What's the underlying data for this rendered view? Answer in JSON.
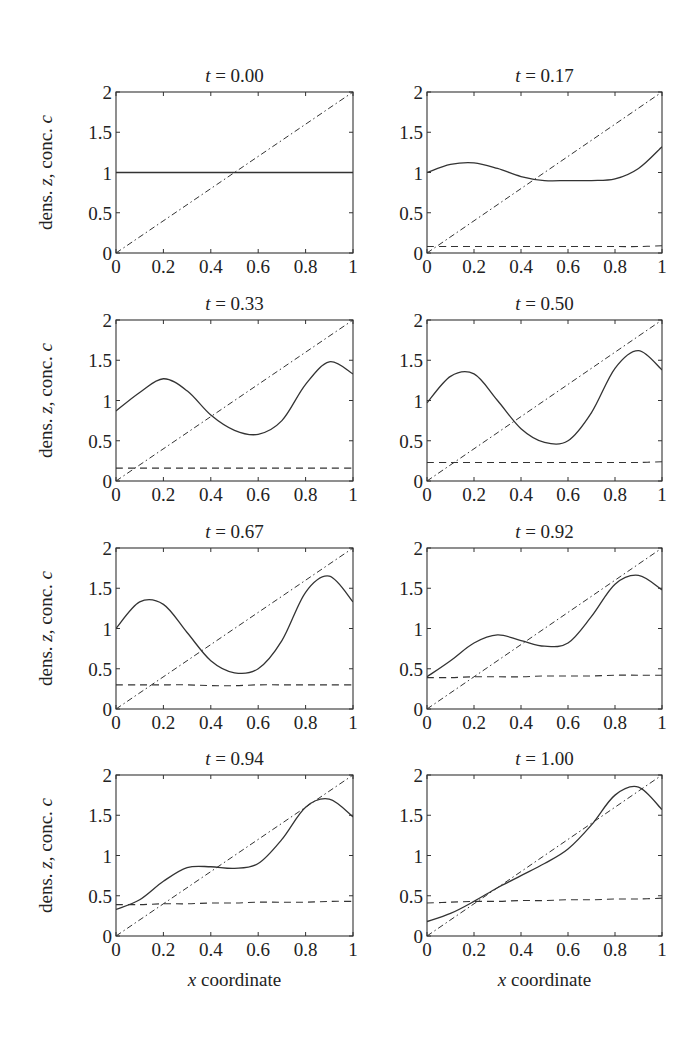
{
  "figure": {
    "ylabel": "dens. z, conc. c",
    "xlabel": "x coordinate"
  },
  "chart_data": [
    {
      "type": "line",
      "title": "t = 0.00",
      "xlabel": "",
      "ylabel": "dens. z, conc. c",
      "xlim": [
        0,
        1
      ],
      "ylim": [
        0,
        2
      ],
      "xticks": [
        "0",
        "0.2",
        "0.4",
        "0.6",
        "0.8",
        "1"
      ],
      "yticks": [
        "0",
        "0.5",
        "1",
        "1.5",
        "2"
      ],
      "grid": false,
      "x": [
        0,
        0.1,
        0.2,
        0.3,
        0.4,
        0.5,
        0.6,
        0.7,
        0.8,
        0.9,
        1.0
      ],
      "series": [
        {
          "name": "density z (solid)",
          "style": "solid",
          "values": [
            1,
            1,
            1,
            1,
            1,
            1,
            1,
            1,
            1,
            1,
            1
          ]
        },
        {
          "name": "dash-dot reference",
          "style": "dashdot",
          "values": [
            0,
            0.2,
            0.4,
            0.6,
            0.8,
            1.0,
            1.2,
            1.4,
            1.6,
            1.8,
            2.0
          ]
        }
      ]
    },
    {
      "type": "line",
      "title": "t = 0.17",
      "xlabel": "",
      "ylabel": "",
      "xlim": [
        0,
        1
      ],
      "ylim": [
        0,
        2
      ],
      "xticks": [
        "0",
        "0.2",
        "0.4",
        "0.6",
        "0.8",
        "1"
      ],
      "yticks": [
        "0",
        "0.5",
        "1",
        "1.5",
        "2"
      ],
      "grid": false,
      "x": [
        0,
        0.1,
        0.2,
        0.3,
        0.4,
        0.5,
        0.6,
        0.7,
        0.8,
        0.9,
        1.0
      ],
      "series": [
        {
          "name": "density z (solid)",
          "style": "solid",
          "values": [
            1.0,
            1.1,
            1.12,
            1.05,
            0.95,
            0.9,
            0.9,
            0.9,
            0.92,
            1.05,
            1.32
          ]
        },
        {
          "name": "concentration c (dashed)",
          "style": "dashed",
          "values": [
            0.08,
            0.08,
            0.08,
            0.08,
            0.08,
            0.08,
            0.08,
            0.08,
            0.08,
            0.08,
            0.09
          ]
        },
        {
          "name": "dash-dot reference",
          "style": "dashdot",
          "values": [
            0,
            0.2,
            0.4,
            0.6,
            0.8,
            1.0,
            1.2,
            1.4,
            1.6,
            1.8,
            2.0
          ]
        }
      ]
    },
    {
      "type": "line",
      "title": "t = 0.33",
      "xlabel": "",
      "ylabel": "dens. z, conc. c",
      "xlim": [
        0,
        1
      ],
      "ylim": [
        0,
        2
      ],
      "xticks": [
        "0",
        "0.2",
        "0.4",
        "0.6",
        "0.8",
        "1"
      ],
      "yticks": [
        "0",
        "0.5",
        "1",
        "1.5",
        "2"
      ],
      "grid": false,
      "x": [
        0,
        0.1,
        0.2,
        0.3,
        0.4,
        0.5,
        0.6,
        0.7,
        0.8,
        0.9,
        1.0
      ],
      "series": [
        {
          "name": "density z (solid)",
          "style": "solid",
          "values": [
            0.87,
            1.1,
            1.27,
            1.12,
            0.82,
            0.63,
            0.58,
            0.75,
            1.2,
            1.48,
            1.33
          ]
        },
        {
          "name": "concentration c (dashed)",
          "style": "dashed",
          "values": [
            0.16,
            0.16,
            0.16,
            0.16,
            0.16,
            0.16,
            0.16,
            0.16,
            0.16,
            0.16,
            0.16
          ]
        },
        {
          "name": "dash-dot reference",
          "style": "dashdot",
          "values": [
            0,
            0.2,
            0.4,
            0.6,
            0.8,
            1.0,
            1.2,
            1.4,
            1.6,
            1.8,
            2.0
          ]
        }
      ]
    },
    {
      "type": "line",
      "title": "t = 0.50",
      "xlabel": "",
      "ylabel": "",
      "xlim": [
        0,
        1
      ],
      "ylim": [
        0,
        2
      ],
      "xticks": [
        "0",
        "0.2",
        "0.4",
        "0.6",
        "0.8",
        "1"
      ],
      "yticks": [
        "0",
        "0.5",
        "1",
        "1.5",
        "2"
      ],
      "grid": false,
      "x": [
        0,
        0.1,
        0.2,
        0.3,
        0.4,
        0.5,
        0.6,
        0.7,
        0.8,
        0.9,
        1.0
      ],
      "series": [
        {
          "name": "density z (solid)",
          "style": "solid",
          "values": [
            0.97,
            1.3,
            1.33,
            1.0,
            0.65,
            0.48,
            0.5,
            0.85,
            1.4,
            1.62,
            1.38
          ]
        },
        {
          "name": "concentration c (dashed)",
          "style": "dashed",
          "values": [
            0.23,
            0.23,
            0.23,
            0.23,
            0.23,
            0.23,
            0.23,
            0.23,
            0.23,
            0.23,
            0.24
          ]
        },
        {
          "name": "dash-dot reference",
          "style": "dashdot",
          "values": [
            0,
            0.2,
            0.4,
            0.6,
            0.8,
            1.0,
            1.2,
            1.4,
            1.6,
            1.8,
            2.0
          ]
        }
      ]
    },
    {
      "type": "line",
      "title": "t = 0.67",
      "xlabel": "",
      "ylabel": "dens. z, conc. c",
      "xlim": [
        0,
        1
      ],
      "ylim": [
        0,
        2
      ],
      "xticks": [
        "0",
        "0.2",
        "0.4",
        "0.6",
        "0.8",
        "1"
      ],
      "yticks": [
        "0",
        "0.5",
        "1",
        "1.5",
        "2"
      ],
      "grid": false,
      "x": [
        0,
        0.1,
        0.2,
        0.3,
        0.4,
        0.5,
        0.6,
        0.7,
        0.8,
        0.9,
        1.0
      ],
      "series": [
        {
          "name": "density z (solid)",
          "style": "solid",
          "values": [
            1.0,
            1.33,
            1.3,
            0.95,
            0.6,
            0.45,
            0.5,
            0.85,
            1.45,
            1.65,
            1.33
          ]
        },
        {
          "name": "concentration c (dashed)",
          "style": "dashed",
          "values": [
            0.3,
            0.3,
            0.3,
            0.3,
            0.29,
            0.29,
            0.3,
            0.3,
            0.3,
            0.3,
            0.3
          ]
        },
        {
          "name": "dash-dot reference",
          "style": "dashdot",
          "values": [
            0,
            0.2,
            0.4,
            0.6,
            0.8,
            1.0,
            1.2,
            1.4,
            1.6,
            1.8,
            2.0
          ]
        }
      ]
    },
    {
      "type": "line",
      "title": "t = 0.92",
      "xlabel": "",
      "ylabel": "",
      "xlim": [
        0,
        1
      ],
      "ylim": [
        0,
        2
      ],
      "xticks": [
        "0",
        "0.2",
        "0.4",
        "0.6",
        "0.8",
        "1"
      ],
      "yticks": [
        "0",
        "0.5",
        "1",
        "1.5",
        "2"
      ],
      "grid": false,
      "x": [
        0,
        0.1,
        0.2,
        0.3,
        0.4,
        0.5,
        0.6,
        0.7,
        0.8,
        0.9,
        1.0
      ],
      "series": [
        {
          "name": "density z (solid)",
          "style": "solid",
          "values": [
            0.4,
            0.6,
            0.82,
            0.92,
            0.85,
            0.78,
            0.82,
            1.15,
            1.55,
            1.66,
            1.48
          ]
        },
        {
          "name": "concentration c (dashed)",
          "style": "dashed",
          "values": [
            0.39,
            0.39,
            0.4,
            0.4,
            0.4,
            0.41,
            0.41,
            0.41,
            0.42,
            0.42,
            0.42
          ]
        },
        {
          "name": "dash-dot reference",
          "style": "dashdot",
          "values": [
            0,
            0.2,
            0.4,
            0.6,
            0.8,
            1.0,
            1.2,
            1.4,
            1.6,
            1.8,
            2.0
          ]
        }
      ]
    },
    {
      "type": "line",
      "title": "t = 0.94",
      "xlabel": "x coordinate",
      "ylabel": "dens. z, conc. c",
      "xlim": [
        0,
        1
      ],
      "ylim": [
        0,
        2
      ],
      "xticks": [
        "0",
        "0.2",
        "0.4",
        "0.6",
        "0.8",
        "1"
      ],
      "yticks": [
        "0",
        "0.5",
        "1",
        "1.5",
        "2"
      ],
      "grid": false,
      "x": [
        0,
        0.1,
        0.2,
        0.3,
        0.4,
        0.5,
        0.6,
        0.7,
        0.8,
        0.9,
        1.0
      ],
      "series": [
        {
          "name": "density z (solid)",
          "style": "solid",
          "values": [
            0.33,
            0.45,
            0.68,
            0.85,
            0.86,
            0.84,
            0.9,
            1.2,
            1.6,
            1.7,
            1.48
          ]
        },
        {
          "name": "concentration c (dashed)",
          "style": "dashed",
          "values": [
            0.39,
            0.39,
            0.4,
            0.4,
            0.41,
            0.41,
            0.42,
            0.42,
            0.42,
            0.43,
            0.43
          ]
        },
        {
          "name": "dash-dot reference",
          "style": "dashdot",
          "values": [
            0,
            0.2,
            0.4,
            0.6,
            0.8,
            1.0,
            1.2,
            1.4,
            1.6,
            1.8,
            2.0
          ]
        }
      ]
    },
    {
      "type": "line",
      "title": "t = 1.00",
      "xlabel": "x coordinate",
      "ylabel": "",
      "xlim": [
        0,
        1
      ],
      "ylim": [
        0,
        2
      ],
      "xticks": [
        "0",
        "0.2",
        "0.4",
        "0.6",
        "0.8",
        "1"
      ],
      "yticks": [
        "0",
        "0.5",
        "1",
        "1.5",
        "2"
      ],
      "grid": false,
      "x": [
        0,
        0.1,
        0.2,
        0.3,
        0.4,
        0.5,
        0.6,
        0.7,
        0.8,
        0.9,
        1.0
      ],
      "series": [
        {
          "name": "density z (solid)",
          "style": "solid",
          "values": [
            0.18,
            0.28,
            0.43,
            0.6,
            0.75,
            0.9,
            1.08,
            1.38,
            1.75,
            1.85,
            1.57
          ]
        },
        {
          "name": "concentration c (dashed)",
          "style": "dashed",
          "values": [
            0.41,
            0.42,
            0.43,
            0.43,
            0.44,
            0.44,
            0.45,
            0.45,
            0.46,
            0.46,
            0.47
          ]
        },
        {
          "name": "dash-dot reference",
          "style": "dashdot",
          "values": [
            0,
            0.2,
            0.4,
            0.6,
            0.8,
            1.0,
            1.2,
            1.4,
            1.6,
            1.8,
            2.0
          ]
        }
      ]
    }
  ]
}
